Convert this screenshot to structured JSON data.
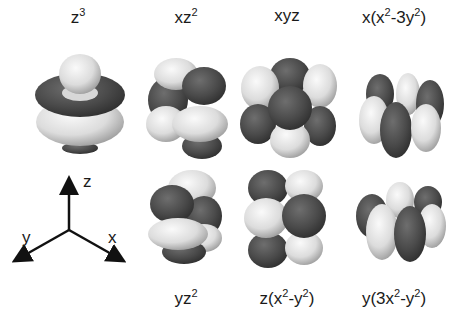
{
  "figure": {
    "colors": {
      "dark_lobe": "#4a4a4a",
      "light_lobe": "#e6e6e6",
      "background": "#ffffff",
      "text": "#1a1a1a"
    },
    "orbitals": [
      {
        "id": "z3",
        "base": "z",
        "sup": "3",
        "tail": "",
        "row": 1,
        "col": 1
      },
      {
        "id": "xz2",
        "base": "xz",
        "sup": "2",
        "tail": "",
        "row": 1,
        "col": 2
      },
      {
        "id": "xyz",
        "base": "xyz",
        "sup": "",
        "tail": "",
        "row": 1,
        "col": 3
      },
      {
        "id": "x(x2-3y2)",
        "parts": [
          "x(x",
          "2",
          "-3y",
          "2",
          ")"
        ],
        "row": 1,
        "col": 4
      },
      {
        "id": "yz2",
        "base": "yz",
        "sup": "2",
        "tail": "",
        "row": 2,
        "col": 2
      },
      {
        "id": "z(x2-y2)",
        "parts": [
          "z(x",
          "2",
          "-y",
          "2",
          ")"
        ],
        "row": 2,
        "col": 3
      },
      {
        "id": "y(3x2-y2)",
        "parts": [
          "y(3x",
          "2",
          "-y",
          "2",
          ")"
        ],
        "row": 2,
        "col": 4
      }
    ],
    "axes": {
      "z": "z",
      "y": "y",
      "x": "x"
    }
  }
}
